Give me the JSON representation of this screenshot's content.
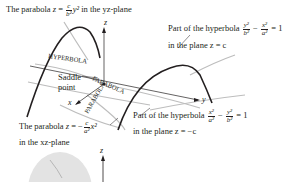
{
  "figure": {
    "top_left_label": {
      "prefix": "The parabola ",
      "var": "z",
      "eq": " = ",
      "num": "c",
      "den": "b²",
      "term": "y²",
      "suffix": " in the yz-plane"
    },
    "top_right_label": {
      "line1_prefix": "Part of the hyperbola ",
      "frac1_num": "y²",
      "frac1_den": "b²",
      "minus": " − ",
      "frac2_num": "x²",
      "frac2_den": "a²",
      "eq": " = 1",
      "line2": "in the plane z = c"
    },
    "middle_right_label": {
      "line1_prefix": "Part of the hyperbola ",
      "frac1_num": "x²",
      "frac1_den": "a²",
      "minus": " − ",
      "frac2_num": "y²",
      "frac2_den": "b²",
      "eq": " = 1",
      "line2": "in the plane z = −c"
    },
    "bottom_left_label": {
      "prefix": "The parabola ",
      "var": "z",
      "eq": " = −",
      "num": "c",
      "den": "a²",
      "term": "x²",
      "line2": "in the xz-plane"
    },
    "saddle_label": [
      "Saddle",
      "point"
    ],
    "curve_tags": {
      "hyperbola": "HYPERBOLA",
      "parabola_upper": "PARABOLA",
      "parabola_lower": "PARABOLA"
    },
    "axes": {
      "x": "x",
      "y": "y",
      "z": "z",
      "z2": "z"
    }
  }
}
